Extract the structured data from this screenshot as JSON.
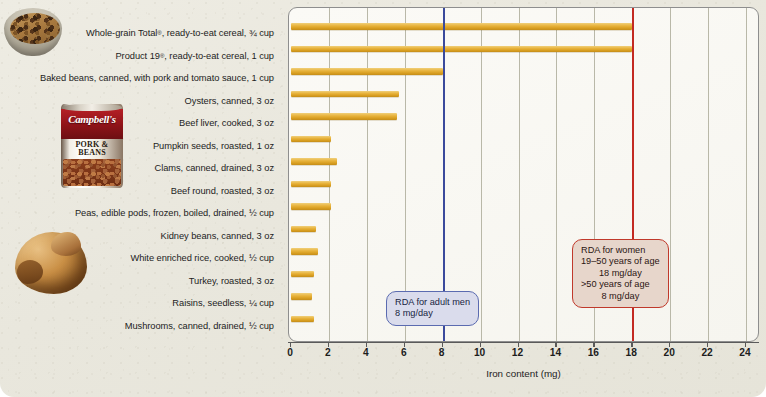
{
  "chart_data": {
    "type": "bar",
    "orientation": "horizontal",
    "title": "",
    "xlabel": "Iron content (mg)",
    "ylabel": "",
    "xlim": [
      0,
      24
    ],
    "xticks": [
      0,
      2,
      4,
      6,
      8,
      10,
      12,
      14,
      16,
      18,
      20,
      22,
      24
    ],
    "grid": "vertical",
    "legend": "none",
    "bar_color": "#E8B33C",
    "categories": [
      "Whole-grain Total®, ready-to-eat cereal, ¾ cup",
      "Product 19®, ready-to-eat cereal, 1 cup",
      "Baked beans, canned, with pork and tomato sauce, 1 cup",
      "Oysters, canned, 3 oz",
      "Beef liver, cooked, 3 oz",
      "Pumpkin seeds, roasted, 1 oz",
      "Clams, canned, drained, 3 oz",
      "Beef round, roasted, 3 oz",
      "Peas, edible pods, frozen, boiled, drained, ½ cup",
      "Kidney beans, canned, 3 oz",
      "White enriched rice, cooked, ½ cup",
      "Turkey, roasted, 3 oz",
      "Raisins, seedless, ¼ cup",
      "Mushrooms, canned, drained, ½ cup"
    ],
    "values": [
      18.0,
      18.0,
      8.0,
      5.7,
      5.6,
      2.1,
      2.4,
      2.1,
      2.1,
      1.3,
      1.4,
      1.2,
      1.1,
      1.2
    ],
    "annotations": [
      {
        "name": "rda-adult-men",
        "x": 8,
        "color": "#3B4A9C",
        "lines": [
          "RDA for adult men",
          "8 mg/day"
        ]
      },
      {
        "name": "rda-women",
        "x": 18,
        "color": "#C32A22",
        "lines": [
          "RDA for women",
          "19–50 years of age",
          "18 mg/day",
          ">50 years of age",
          "8 mg/day"
        ]
      }
    ]
  },
  "labels": [
    {
      "pre": "Whole-grain Total",
      "sup": "®",
      "post": ", ready-to-eat cereal, ¾ cup"
    },
    {
      "pre": "Product 19",
      "sup": "®",
      "post": ", ready-to-eat cereal, 1 cup"
    },
    {
      "pre": "Baked beans, canned, with pork and tomato sauce, 1 cup",
      "sup": "",
      "post": ""
    },
    {
      "pre": "Oysters, canned, 3 oz",
      "sup": "",
      "post": ""
    },
    {
      "pre": "Beef liver, cooked, 3 oz",
      "sup": "",
      "post": ""
    },
    {
      "pre": "Pumpkin seeds, roasted, 1 oz",
      "sup": "",
      "post": ""
    },
    {
      "pre": "Clams, canned, drained, 3 oz",
      "sup": "",
      "post": ""
    },
    {
      "pre": "Beef round, roasted, 3 oz",
      "sup": "",
      "post": ""
    },
    {
      "pre": "Peas, edible pods, frozen, boiled, drained, ½ cup",
      "sup": "",
      "post": ""
    },
    {
      "pre": "Kidney beans, canned, 3 oz",
      "sup": "",
      "post": ""
    },
    {
      "pre": "White enriched rice, cooked, ½ cup",
      "sup": "",
      "post": ""
    },
    {
      "pre": "Turkey, roasted, 3 oz",
      "sup": "",
      "post": ""
    },
    {
      "pre": "Raisins, seedless, ¼ cup",
      "sup": "",
      "post": ""
    },
    {
      "pre": "Mushrooms, canned, drained, ½ cup",
      "sup": "",
      "post": ""
    }
  ],
  "callouts": {
    "men": {
      "line1": "RDA for adult men",
      "line2": "8 mg/day"
    },
    "women": {
      "line1": "RDA for women",
      "line2": "19–50 years of age",
      "line3": "18 mg/day",
      "line4": ">50 years of age",
      "line5": "8 mg/day"
    }
  },
  "axis_title": "Iron content (mg)",
  "photos": {
    "cereal_label": "cereal-bowl-photo",
    "can_brand": "Campbell's",
    "can_product": "PORK &\nBEANS",
    "turkey_label": "roasted-turkey-photo"
  },
  "colors": {
    "bar": "#E8B33C",
    "rda_men": "#3B4A9C",
    "rda_women": "#C32A22",
    "grid": "#B9B8A8",
    "page_bg": "#E9E7DD"
  }
}
